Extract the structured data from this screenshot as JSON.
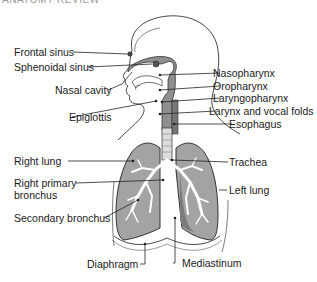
{
  "diagram": {
    "title_cropped": "ANATOMY REVIEW",
    "type": "anatomical illustration",
    "colors": {
      "outline": "#333333",
      "lung_fill": "#a3a3a3",
      "lung_inner": "#8c8c8c",
      "airway_fill": "#8f8f8f",
      "bronchi": "#ffffff",
      "background": "#ffffff"
    },
    "labels_left": [
      {
        "id": "frontal-sinus",
        "text": "Frontal sinus"
      },
      {
        "id": "sphenoidal-sinus",
        "text": "Sphenoidal sinus"
      },
      {
        "id": "nasal-cavity",
        "text": "Nasal cavity"
      },
      {
        "id": "epiglottis",
        "text": "Epiglottis"
      },
      {
        "id": "right-lung",
        "text": "Right lung"
      },
      {
        "id": "right-primary-bronchus-1",
        "text": "Right primary"
      },
      {
        "id": "right-primary-bronchus-2",
        "text": "bronchus"
      },
      {
        "id": "secondary-bronchus",
        "text": "Secondary bronchus"
      },
      {
        "id": "diaphragm",
        "text": "Diaphragm"
      }
    ],
    "labels_right": [
      {
        "id": "nasopharynx",
        "text": "Nasopharynx"
      },
      {
        "id": "oropharynx",
        "text": "Oropharynx"
      },
      {
        "id": "laryngopharynx",
        "text": "Laryngopharynx"
      },
      {
        "id": "larynx",
        "text": "Larynx and vocal folds"
      },
      {
        "id": "esophagus",
        "text": "Esophagus"
      },
      {
        "id": "trachea",
        "text": "Trachea"
      },
      {
        "id": "left-lung",
        "text": "Left lung"
      },
      {
        "id": "mediastinum",
        "text": "Mediastinum"
      }
    ]
  }
}
